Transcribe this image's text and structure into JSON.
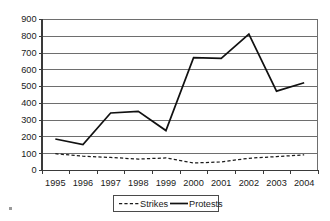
{
  "chart_data": {
    "type": "line",
    "title": "",
    "subtitle": "",
    "xlabel": "",
    "ylabel": "",
    "categories": [
      "1995",
      "1996",
      "1997",
      "1998",
      "1999",
      "2000",
      "2001",
      "2002",
      "2003",
      "2004"
    ],
    "series": [
      {
        "name": "Strikes",
        "style": "dashed",
        "color": "#1b1b1b",
        "values": [
          97,
          82,
          75,
          65,
          72,
          42,
          48,
          70,
          80,
          90
        ]
      },
      {
        "name": "Protests",
        "style": "solid",
        "color": "#111111",
        "values": [
          185,
          152,
          340,
          350,
          235,
          670,
          665,
          810,
          470,
          520
        ]
      }
    ],
    "ylim": [
      0,
      900
    ],
    "ytick_step": 100,
    "ytick_labels": [
      "0",
      "100",
      "200",
      "300",
      "400",
      "500",
      "600",
      "700",
      "800",
      "900"
    ],
    "xtick_labels": [
      "1995",
      "1996",
      "1997",
      "1998",
      "1999",
      "2000",
      "2001",
      "2002",
      "2003",
      "2004"
    ],
    "grid": "horizontal",
    "legend_position": "bottom",
    "legend_entries": [
      "Strikes",
      "Protests"
    ]
  }
}
